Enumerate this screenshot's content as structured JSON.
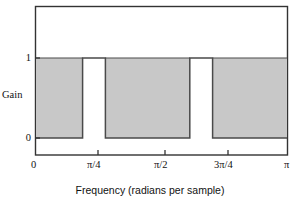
{
  "chart_data": {
    "type": "area",
    "title": "",
    "subtitle": "",
    "xlabel": "Frequency (radians per sample)",
    "ylabel": "Gain",
    "xlim": [
      0,
      3.14159265
    ],
    "ylim": [
      -0.25,
      1.6
    ],
    "grid": false,
    "legend": null,
    "annotations": [],
    "xtick_labels": [
      "0",
      "π/4",
      "π/2",
      "3π/4",
      "π"
    ],
    "xtick_values": [
      0,
      0.78539816,
      1.57079633,
      2.35619449,
      3.14159265
    ],
    "ytick_labels": [
      "0",
      "1"
    ],
    "ytick_values": [
      0,
      1
    ],
    "fill_color": "#c8c8c8",
    "line_color": "#4a4a4a",
    "axis_color": "#333333",
    "series": [
      {
        "name": "Gain",
        "step": true,
        "x": [
          0.0,
          0.5832,
          0.5832,
          0.8685,
          0.8685,
          1.9251,
          1.9251,
          2.2104,
          2.2104,
          3.14159265
        ],
        "values": [
          0,
          0,
          1,
          1,
          0,
          0,
          1,
          1,
          0,
          0
        ]
      }
    ],
    "bands": [
      {
        "name": "stopband-1",
        "x_start": 0.0,
        "x_end": 0.5832,
        "gain": 0
      },
      {
        "name": "passband-1",
        "x_start": 0.5832,
        "x_end": 0.8685,
        "gain": 1
      },
      {
        "name": "stopband-2",
        "x_start": 0.8685,
        "x_end": 1.9251,
        "gain": 0
      },
      {
        "name": "passband-2",
        "x_start": 1.9251,
        "x_end": 2.2104,
        "gain": 1
      },
      {
        "name": "stopband-3",
        "x_start": 2.2104,
        "x_end": 3.14159265,
        "gain": 0
      }
    ]
  },
  "axes": {
    "x_title": "Frequency (radians per sample)",
    "y_title": "Gain",
    "x_ticks": [
      {
        "label": "0",
        "left": 35
      },
      {
        "label": "π/4",
        "left": 98
      },
      {
        "label": "π/2",
        "left": 165
      },
      {
        "label": "3π/4",
        "left": 228
      },
      {
        "label": "π",
        "left": 288
      }
    ],
    "y_ticks": [
      {
        "label": "1",
        "top": 58
      },
      {
        "label": "0",
        "top": 138
      }
    ]
  }
}
